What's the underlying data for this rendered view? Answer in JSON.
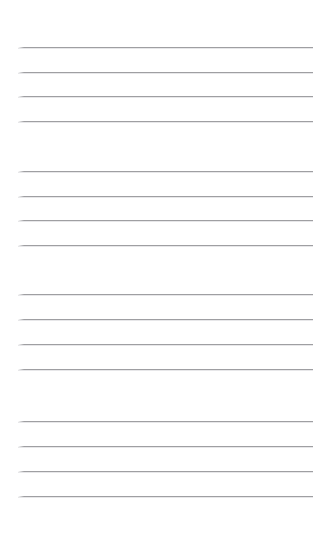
{
  "page": {
    "kind": "ruled-notepaper-scan",
    "width": 329,
    "height": 538,
    "background_color": "#ffffff",
    "rule_color": "#9a9a9e",
    "rule_shadow_color": "#e6e6e8",
    "rule_thickness_px": 1,
    "rule_left_px": 18,
    "rule_right_px": 313,
    "rule_length_px": 295,
    "total_rules": 16,
    "group_count": 4,
    "rules_per_group": 4,
    "intra_group_spacing_px": 25,
    "inter_group_gap_px": 50,
    "margin_top_px": 47,
    "margin_bottom_px": 42,
    "has_text": false,
    "has_margin_line": false,
    "has_holes": false
  },
  "rules": [
    {
      "index": 1,
      "group": 1,
      "y": 47
    },
    {
      "index": 2,
      "group": 1,
      "y": 72
    },
    {
      "index": 3,
      "group": 1,
      "y": 96
    },
    {
      "index": 4,
      "group": 1,
      "y": 121
    },
    {
      "index": 5,
      "group": 2,
      "y": 171
    },
    {
      "index": 6,
      "group": 2,
      "y": 196
    },
    {
      "index": 7,
      "group": 2,
      "y": 220
    },
    {
      "index": 8,
      "group": 2,
      "y": 245
    },
    {
      "index": 9,
      "group": 3,
      "y": 294
    },
    {
      "index": 10,
      "group": 3,
      "y": 319
    },
    {
      "index": 11,
      "group": 3,
      "y": 344
    },
    {
      "index": 12,
      "group": 3,
      "y": 369
    },
    {
      "index": 13,
      "group": 4,
      "y": 421
    },
    {
      "index": 14,
      "group": 4,
      "y": 446
    },
    {
      "index": 15,
      "group": 4,
      "y": 471
    },
    {
      "index": 16,
      "group": 4,
      "y": 496
    }
  ]
}
